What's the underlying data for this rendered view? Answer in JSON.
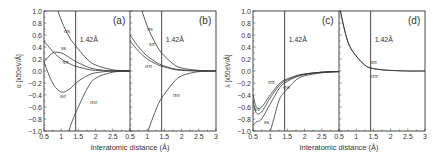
{
  "figure": {
    "left_group": {
      "ylabel": "α [x50eV/Å]",
      "xlabel": "Interatomic distance (Å)"
    },
    "right_group": {
      "ylabel": "λ [x50eV/Å]",
      "xlabel": "Interatomic distance (Å)"
    },
    "annotation": "1.42Å",
    "panels": [
      {
        "id": "a",
        "label": "(a)"
      },
      {
        "id": "b",
        "label": "(b)"
      },
      {
        "id": "c",
        "label": "(c)"
      },
      {
        "id": "d",
        "label": "(d)"
      }
    ],
    "yticks": [
      "1.0",
      "0.8",
      "0.6",
      "0.4",
      "0.2",
      "0.0",
      "−0.2",
      "−0.4",
      "−0.6",
      "−0.8",
      "−1.0"
    ],
    "xticks": [
      "0.5",
      "1",
      "1.5",
      "2",
      "2.5"
    ],
    "xtick_last": "3"
  },
  "chart_data": [
    {
      "type": "line",
      "panel": "(a)",
      "title": "",
      "xlabel": "Interatomic distance (Å)",
      "ylabel": "α [x50eV/Å]",
      "xlim": [
        0.5,
        3.0
      ],
      "ylim": [
        -1.0,
        1.0
      ],
      "vline": {
        "x": 1.42,
        "label": "1.42Å"
      },
      "x": [
        0.5,
        0.75,
        1.0,
        1.25,
        1.42,
        1.75,
        2.0,
        2.5,
        3.0
      ],
      "series": [
        {
          "name": "σs",
          "values": [
            1.9,
            1.3,
            0.85,
            0.55,
            0.42,
            0.2,
            0.1,
            0.02,
            0.0
          ]
        },
        {
          "name": "ss",
          "values": [
            0.15,
            0.3,
            0.3,
            0.22,
            0.16,
            0.07,
            0.03,
            0.0,
            0.0
          ]
        },
        {
          "name": "ππ",
          "values": [
            0.5,
            0.33,
            0.2,
            0.12,
            0.08,
            0.03,
            0.01,
            0.0,
            0.0
          ]
        },
        {
          "name": "sσ",
          "values": [
            0.15,
            -0.2,
            -0.35,
            -0.3,
            -0.2,
            -0.08,
            -0.03,
            0.0,
            0.0
          ]
        },
        {
          "name": "σσ",
          "values": [
            -3.0,
            -2.0,
            -1.4,
            -0.95,
            -0.7,
            -0.3,
            -0.12,
            -0.02,
            0.0
          ]
        }
      ]
    },
    {
      "type": "line",
      "panel": "(b)",
      "xlabel": "Interatomic distance (Å)",
      "xlim": [
        0.5,
        3.0
      ],
      "ylim": [
        -1.0,
        1.0
      ],
      "vline": {
        "x": 1.42,
        "label": "1.42Å"
      },
      "x": [
        0.5,
        0.75,
        1.0,
        1.25,
        1.42,
        1.75,
        2.0,
        2.5,
        3.0
      ],
      "series": [
        {
          "name": "πs",
          "values": [
            1.8,
            1.2,
            0.75,
            0.45,
            0.3,
            0.12,
            0.05,
            0.01,
            0.0
          ]
        },
        {
          "name": "sπ",
          "values": [
            0.6,
            0.4,
            0.25,
            0.15,
            0.1,
            0.04,
            0.02,
            0.0,
            0.0
          ]
        },
        {
          "name": "σπ",
          "values": [
            0.5,
            0.33,
            0.2,
            0.12,
            0.08,
            0.03,
            0.01,
            0.0,
            0.0
          ]
        },
        {
          "name": "πσ",
          "values": [
            -2.5,
            -1.6,
            -1.05,
            -0.65,
            -0.45,
            -0.2,
            -0.08,
            -0.01,
            0.0
          ]
        }
      ]
    },
    {
      "type": "line",
      "panel": "(c)",
      "xlabel": "Interatomic distance (Å)",
      "ylabel": "λ [x50eV/Å]",
      "xlim": [
        0.5,
        3.0
      ],
      "ylim": [
        -1.0,
        1.0
      ],
      "vline": {
        "x": 1.42,
        "label": "1.42Å"
      },
      "x": [
        0.5,
        0.6,
        0.75,
        1.0,
        1.25,
        1.42,
        1.75,
        2.0,
        2.5,
        3.0
      ],
      "series": [
        {
          "name": "ππ",
          "values": [
            -0.4,
            -0.6,
            -0.6,
            -0.4,
            -0.22,
            -0.15,
            -0.08,
            -0.05,
            -0.02,
            -0.01
          ]
        },
        {
          "name": "sσ",
          "values": [
            -0.5,
            -0.7,
            -0.68,
            -0.45,
            -0.25,
            -0.17,
            -0.09,
            -0.05,
            -0.02,
            -0.01
          ]
        },
        {
          "name": "ss",
          "values": [
            -0.9,
            -0.85,
            -0.8,
            -0.55,
            -0.3,
            -0.2,
            -0.1,
            -0.06,
            -0.02,
            -0.01
          ]
        },
        {
          "name": "σσ",
          "values": [
            -2.0,
            -1.7,
            -1.3,
            -1.0,
            -0.5,
            -0.35,
            -0.15,
            -0.08,
            -0.03,
            -0.01
          ]
        }
      ]
    },
    {
      "type": "line",
      "panel": "(d)",
      "xlabel": "Interatomic distance (Å)",
      "xlim": [
        0.5,
        3.0
      ],
      "ylim": [
        -1.0,
        1.0
      ],
      "vline": {
        "x": 1.42,
        "label": "1.42Å"
      },
      "x": [
        0.5,
        0.75,
        1.0,
        1.25,
        1.42,
        1.75,
        2.0,
        2.5,
        3.0
      ],
      "series": [
        {
          "name": "sπ",
          "values": [
            1.1,
            0.5,
            0.25,
            0.1,
            0.05,
            0.02,
            0.01,
            0.0,
            0.0
          ]
        },
        {
          "name": "σπ",
          "values": [
            1.1,
            0.5,
            0.25,
            0.1,
            0.05,
            0.02,
            0.01,
            0.0,
            0.0
          ]
        }
      ]
    }
  ]
}
